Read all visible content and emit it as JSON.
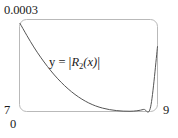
{
  "figure": {
    "name": "error-bound-plot",
    "background_color": "#ffffff",
    "frame_color": "#b9b9b9",
    "curve_color": "#4d4d4d",
    "text_color": "#1a1a1a",
    "curve_label": {
      "prefix": "y",
      "equals": " = ",
      "open_bar": "|",
      "func": "R",
      "subscript": "2",
      "arg": "(x)",
      "close_bar": "|",
      "full": "y = |R2(x)|"
    }
  },
  "chart_data": {
    "type": "line",
    "title": "",
    "xlabel": "",
    "ylabel": "",
    "xlim": [
      7,
      9
    ],
    "ylim": [
      0,
      0.0003
    ],
    "grid": false,
    "legend": null,
    "annotations": [
      {
        "text": "y = |R2(x)|",
        "x": 7.45,
        "y": 0.000195
      }
    ],
    "axis_ticks": {
      "y_top": "0.0003",
      "y_bottom": "0",
      "x_left": "7",
      "x_right": "9"
    },
    "series": [
      {
        "name": "|R2(x)|",
        "x": [
          7.0,
          7.1,
          7.2,
          7.3,
          7.4,
          7.5,
          7.6,
          7.7,
          7.8,
          7.9,
          8.0,
          8.1,
          8.2,
          8.3,
          8.4,
          8.5,
          8.6,
          8.7,
          8.8,
          8.9,
          9.0
        ],
        "y": [
          0.000292,
          0.000252,
          0.000214,
          0.00018,
          0.000149,
          0.000121,
          9.65e-05,
          7.5e-05,
          5.65e-05,
          4.1e-05,
          2.83e-05,
          1.85e-05,
          1.13e-05,
          6.3e-06,
          3.1e-06,
          1.3e-06,
          8e-07,
          2.4e-06,
          7e-06,
          1.55e-05,
          0.000215
        ]
      }
    ]
  }
}
